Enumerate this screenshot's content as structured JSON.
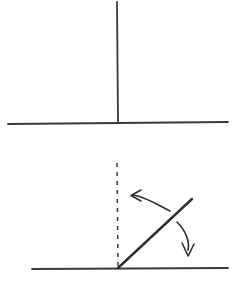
{
  "figure": {
    "background_color": "#ffffff",
    "ink_color": "#3a3a3a",
    "ink_color_dark": "#2e2e2e",
    "width": 244,
    "height": 289
  },
  "panels": [
    {
      "id": "top-panel",
      "name": "upright-line-panel",
      "caption": "",
      "elements": [
        {
          "name": "ground-line-top",
          "kind": "line",
          "style": "solid",
          "x1": 8,
          "y1": 124,
          "x2": 228,
          "y2": 122,
          "stroke_width": 1.8,
          "color": "#3a3a3a"
        },
        {
          "name": "vertical-line",
          "kind": "line",
          "style": "solid",
          "x1": 117,
          "y1": 2,
          "x2": 118,
          "y2": 123,
          "stroke_width": 1.8,
          "color": "#3a3a3a"
        }
      ]
    },
    {
      "id": "bottom-panel",
      "name": "tilted-line-panel",
      "caption": "",
      "elements": [
        {
          "name": "ground-line-bottom",
          "kind": "line",
          "style": "solid",
          "x1": 32,
          "y1": 269,
          "x2": 228,
          "y2": 268,
          "stroke_width": 1.8,
          "color": "#3a3a3a"
        },
        {
          "name": "reference-dashed-vertical",
          "kind": "line",
          "style": "dashed",
          "x1": 117,
          "y1": 163,
          "x2": 118,
          "y2": 266,
          "stroke_width": 1.5,
          "dash_pattern": "4 5",
          "color": "#3a3a3a"
        },
        {
          "name": "inclined-ray",
          "kind": "line",
          "style": "solid",
          "x1": 118,
          "y1": 268,
          "x2": 192,
          "y2": 199,
          "stroke_width": 2.4,
          "color": "#2e2e2e"
        }
      ]
    }
  ],
  "arrows": [
    {
      "name": "counterclockwise-arrow",
      "direction": "left",
      "meaning": "rotation toward vertical",
      "path": "M 170 211 C 160 206 146 197 133 195",
      "head": "M 141 190 L 131 195.5 L 141 201",
      "stroke_width": 1.6,
      "color": "#2e2e2e"
    },
    {
      "name": "clockwise-arrow",
      "direction": "down",
      "meaning": "rotation away from vertical",
      "path": "M 177 222 C 186 231 190 242 188 250",
      "head": "M 182 243 L 188.2 256 L 194 244",
      "stroke_width": 1.6,
      "color": "#2e2e2e"
    }
  ]
}
